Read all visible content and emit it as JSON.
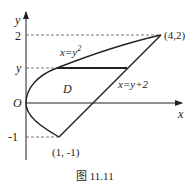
{
  "figure": {
    "caption": "图 11.11",
    "axes": {
      "x_label": "x",
      "y_label": "y",
      "origin_label": "O"
    },
    "y_ticks": {
      "two": "2",
      "y": "y",
      "minus_one": "-1"
    },
    "curves": {
      "parabola_label": "x=y",
      "parabola_exp": "2",
      "line_label": "x=y+2"
    },
    "region_label": "D",
    "points": {
      "upper": "(4,2)",
      "lower": "(1, -1)"
    },
    "colors": {
      "stroke": "#222222",
      "dashed": "#555555"
    }
  }
}
